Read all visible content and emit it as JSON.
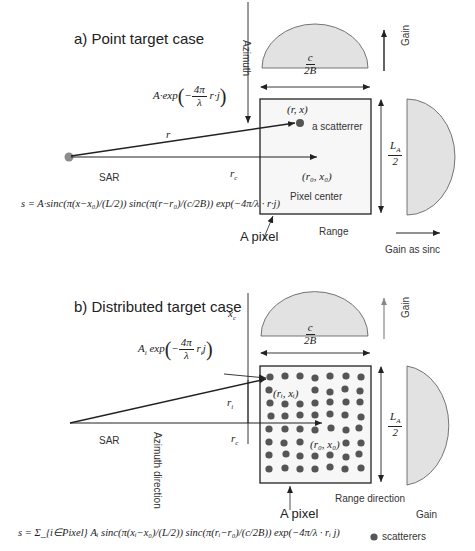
{
  "panel_a": {
    "title": "a) Point target case",
    "azimuth_label": "Azimuth",
    "gain_top_label": "Gain",
    "range_beam_width": {
      "num": "c",
      "den": "2B"
    },
    "azimuth_beam_width": {
      "num": "L_A",
      "num_main": "L",
      "num_sub": "A",
      "den": "2"
    },
    "echo_expr": "A·exp(−4π/λ · r·j)",
    "echo_prefix": "A·exp",
    "echo_frac_num": "4π",
    "echo_frac_den": "λ",
    "echo_suffix": "r·j",
    "range_symbol": "r",
    "rc_symbol": "r",
    "rc_sub": "c",
    "sar_label": "SAR",
    "scatterer_coord": "(r, x)",
    "scatterer_label": "a scatterrer",
    "pixel_center_coord": "(r₀, x₀)",
    "pixel_center_label": "Pixel center",
    "pixel_label": "A pixel",
    "range_label": "Range",
    "gain_side_label": "Gain as sinc",
    "signal_equation": "s = A·sinc(π(x−x₀)/(L/2)) sinc(π(r−r₀)/(c/2B)) exp(−4π/λ · r·j)"
  },
  "panel_b": {
    "title": "b) Distributed target case",
    "xc_symbol": "x",
    "xc_sub": "c",
    "gain_top_label": "Gain",
    "range_beam_width": {
      "num": "c",
      "den": "2B"
    },
    "azimuth_beam_width": {
      "num_main": "L",
      "num_sub": "A",
      "den": "2"
    },
    "echo_prefix": "A",
    "echo_prefix_sub": "i",
    "echo_exp": "exp",
    "echo_frac_num": "4π",
    "echo_frac_den": "λ",
    "echo_suffix": "r",
    "echo_suffix_sub": "i",
    "echo_j": "j",
    "ri_symbol": "r",
    "ri_sub": "i",
    "rc_symbol": "r",
    "rc_sub": "c",
    "sar_label": "SAR",
    "azimuth_direction_label": "Azimuth direction",
    "scatterer_coord": "(rᵢ, xᵢ)",
    "pixel_center_coord": "(r₀, x₀)",
    "pixel_label": "A pixel",
    "range_direction_label": "Range direction",
    "gain_label": "Gain",
    "legend_label": "scatterers",
    "signal_equation": "s = Σ_{i∈Pixel} Aᵢ sinc(π(xᵢ−x₀)/(L/2)) sinc(π(rᵢ−r₀)/(c/2B)) exp(−4π/λ · rᵢ j)",
    "sum_sub": "i∈Pixel"
  },
  "colors": {
    "lobe_fill": "#e2e2e2",
    "lobe_stroke": "#555555",
    "scatterer": "#555555",
    "sar_dot": "#8c8c8c",
    "line": "#222222",
    "pixel_bg": "#f7f7f7"
  }
}
